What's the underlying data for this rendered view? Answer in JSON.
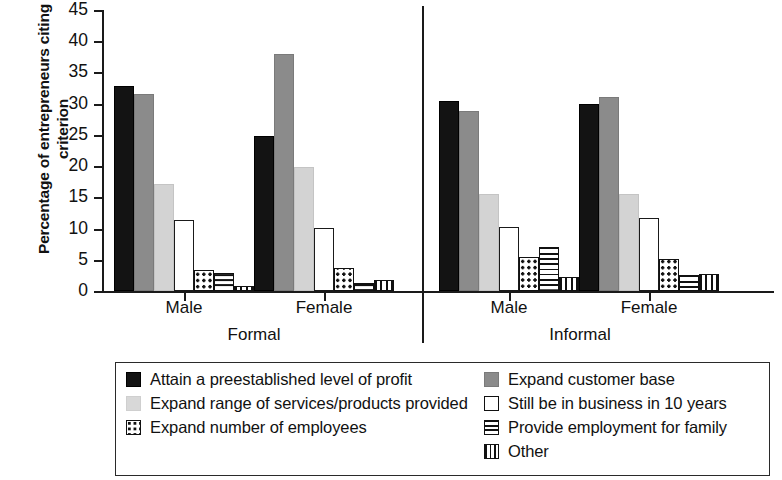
{
  "chart_data": {
    "type": "bar",
    "title": "",
    "xlabel": "",
    "ylabel": "Percentage of entrepreneurs citing criterion",
    "ylim": [
      0,
      45
    ],
    "yticks": [
      0,
      5,
      10,
      15,
      20,
      25,
      30,
      35,
      40,
      45
    ],
    "grid": false,
    "legend_position": "bottom",
    "supergroups": [
      {
        "label": "Formal",
        "categories": [
          "Male",
          "Female"
        ]
      },
      {
        "label": "Informal",
        "categories": [
          "Male",
          "Female"
        ]
      }
    ],
    "categories": [
      "Formal Male",
      "Formal Female",
      "Informal Male",
      "Informal Female"
    ],
    "series": [
      {
        "name": "Attain a preestablished level of profit",
        "pattern": "solid-black",
        "color": "#131313",
        "values": [
          32.8,
          24.8,
          30.5,
          30.0
        ]
      },
      {
        "name": "Expand customer base",
        "pattern": "solid-dark-gray",
        "color": "#8b8b8b",
        "values": [
          31.5,
          38.0,
          28.8,
          31.1
        ]
      },
      {
        "name": "Expand range of services/products provided",
        "pattern": "solid-light-gray",
        "color": "#d3d3d3",
        "values": [
          17.2,
          19.9,
          15.5,
          15.5
        ]
      },
      {
        "name": "Still be in business in 10 years",
        "pattern": "outline-white",
        "color": "#ffffff",
        "values": [
          11.4,
          10.1,
          10.3,
          11.7
        ]
      },
      {
        "name": "Expand number of employees",
        "pattern": "polka-dot",
        "color": "#ffffff",
        "values": [
          3.4,
          3.7,
          5.4,
          5.1
        ]
      },
      {
        "name": "Provide employment for family",
        "pattern": "horizontal-stripes",
        "color": "#ffffff",
        "values": [
          2.9,
          1.3,
          7.0,
          2.5
        ]
      },
      {
        "name": "Other",
        "pattern": "vertical-stripes",
        "color": "#ffffff",
        "values": [
          0.8,
          1.7,
          2.2,
          2.7
        ]
      }
    ]
  },
  "axis": {
    "y_title": "Percentage of entrepreneurs citing criterion",
    "y_tick_labels": [
      "45",
      "40",
      "35",
      "30",
      "25",
      "20",
      "15",
      "10",
      "5",
      "0"
    ]
  },
  "xaxis": {
    "group_labels": [
      "Male",
      "Female",
      "Male",
      "Female"
    ],
    "super_labels": [
      "Formal",
      "Informal"
    ]
  },
  "legend": {
    "left": [
      {
        "label": "Attain a preestablished level of profit",
        "swatch": "solid-black-swatch"
      },
      {
        "label": "Expand range of services/products provided",
        "swatch": "solid-light-gray-swatch"
      },
      {
        "label": "Expand number of employees",
        "swatch": "polka-dot-swatch"
      }
    ],
    "right": [
      {
        "label": "Expand customer base",
        "swatch": "solid-dark-gray-swatch"
      },
      {
        "label": "Still be in business in 10 years",
        "swatch": "outline-white-swatch"
      },
      {
        "label": "Provide employment for family",
        "swatch": "horizontal-stripes-swatch"
      },
      {
        "label": "Other",
        "swatch": "vertical-stripes-swatch"
      }
    ]
  }
}
